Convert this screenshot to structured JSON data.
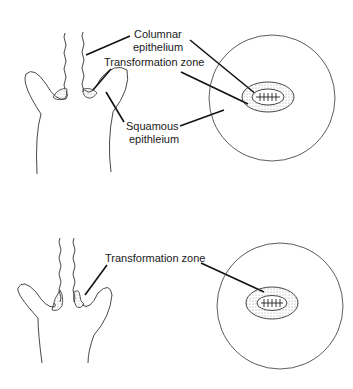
{
  "diagram": {
    "panels": [
      {
        "id": "top",
        "labels": {
          "columnar_line1": "Columnar",
          "columnar_line2": "epithelium",
          "transformation": "Transformation zone",
          "squamous_line1": "Squamous",
          "squamous_line2": "epithleium"
        }
      },
      {
        "id": "bottom",
        "labels": {
          "transformation": "Transformation zone"
        }
      }
    ],
    "colors": {
      "line": "#333333",
      "text": "#1a1a1a",
      "background": "#ffffff"
    }
  }
}
